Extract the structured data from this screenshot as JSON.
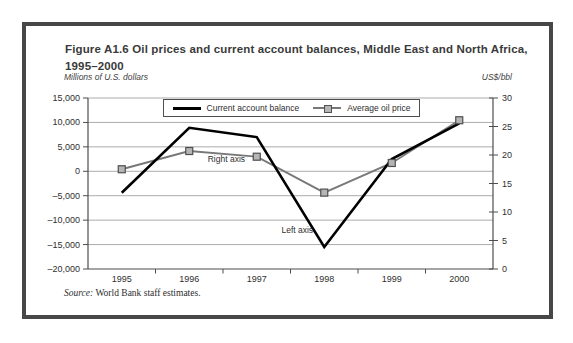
{
  "figure": {
    "title_line1": "Figure A1.6  Oil prices and current account balances, Middle East and North Africa,",
    "title_line2": "1995–2000",
    "left_axis_unit": "Millions of U.S. dollars",
    "right_axis_unit": "US$/bbl",
    "source_prefix": "Source:",
    "source_text": " World Bank staff estimates."
  },
  "legend": {
    "items": [
      {
        "label": "Current account balance"
      },
      {
        "label": "Average oil price"
      }
    ]
  },
  "colors": {
    "current_account_line": "#000000",
    "oil_price_line": "#787878",
    "oil_marker_fill": "#b5b5b5",
    "oil_marker_border": "#4f4f4f",
    "gridline": "#ababab",
    "axis": "#4d4d4d",
    "tick_text": "#2f2f2f"
  },
  "chart_data": {
    "type": "line",
    "title": "Oil prices and current account balances, Middle East and North Africa, 1995–2000",
    "categories": [
      "1995",
      "1996",
      "1997",
      "1998",
      "1999",
      "2000"
    ],
    "series": [
      {
        "name": "Current account balance",
        "axis": "left",
        "values": [
          -4400,
          8900,
          7000,
          -15500,
          2500,
          9800
        ],
        "marker": false
      },
      {
        "name": "Average oil price",
        "axis": "right",
        "values": [
          17.5,
          20.7,
          19.7,
          13.4,
          18.6,
          26.1
        ],
        "marker": true
      }
    ],
    "left_axis": {
      "label": "Millions of U.S. dollars",
      "min": -20000,
      "max": 15000,
      "tick_values": [
        15000,
        10000,
        5000,
        0,
        -5000,
        -10000,
        -15000,
        -20000
      ],
      "tick_labels": [
        "15,000",
        "10,000",
        "5,000",
        "0",
        "–5,000",
        "–10,000",
        "–15,000",
        "–20,000"
      ]
    },
    "right_axis": {
      "label": "US$/bbl",
      "min": 0,
      "max": 30,
      "tick_values": [
        30,
        25,
        20,
        15,
        10,
        5,
        0
      ],
      "tick_labels": [
        "30",
        "25",
        "20",
        "15",
        "10",
        "5",
        "0"
      ]
    },
    "annotations": [
      {
        "text": "Right axis",
        "x_slot": 1.55,
        "y_left": 1800
      },
      {
        "text": "Left axis",
        "x_slot": 2.6,
        "y_left": -12600
      }
    ],
    "grid": true,
    "legend_position": "top-center"
  }
}
